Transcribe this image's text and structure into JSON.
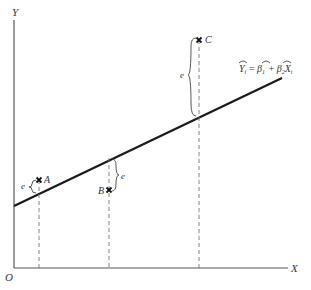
{
  "diagram": {
    "type": "regression-residuals",
    "axes": {
      "y_label": "Y",
      "x_label": "X",
      "origin_label": "O"
    },
    "regression_line": {
      "equation": {
        "lhs": "Y",
        "lhs_sub": "i",
        "eq": "=",
        "b1": "β",
        "b1_sub": "1",
        "plus": "+",
        "b2": "β",
        "b2_sub": "2",
        "x": "X",
        "x_sub": "i"
      }
    },
    "points": [
      {
        "label": "A",
        "residual_label": "e",
        "position": "above line"
      },
      {
        "label": "B",
        "residual_label": "e",
        "position": "below line"
      },
      {
        "label": "C",
        "residual_label": "e",
        "position": "above line"
      }
    ],
    "colors": {
      "axis": "#555555",
      "line": "#1a1a1a",
      "dash": "#777777",
      "text": "#333333"
    }
  }
}
